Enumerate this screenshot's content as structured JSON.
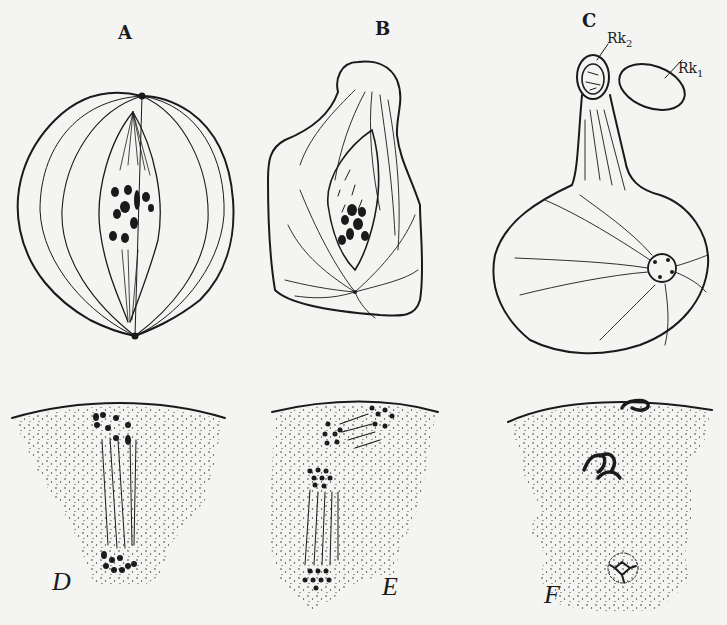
{
  "figure": {
    "panels": [
      {
        "id": "A",
        "label": "A",
        "description": "Spindle with scattered chromosomes in cell"
      },
      {
        "id": "B",
        "label": "B",
        "description": "Cell with protruding bud, spindle and chromosome mass"
      },
      {
        "id": "C",
        "label": "C",
        "description": "Cell with stalk bearing two polar bodies and nucleus"
      },
      {
        "id": "D",
        "label": "D",
        "description": "Anaphase spindle near cell surface (stippled cytoplasm)"
      },
      {
        "id": "E",
        "label": "E",
        "description": "Second spindle and separated chromosome groups"
      },
      {
        "id": "F",
        "label": "F",
        "description": "Chromatin bodies and reconstituted nucleus"
      }
    ],
    "annotations": {
      "rk2": {
        "base": "Rk",
        "sub": "2"
      },
      "rk1": {
        "base": "Rk",
        "sub": "1"
      }
    },
    "colors": {
      "ink": "#1a1a1a",
      "paper": "#f4f4f2"
    }
  }
}
